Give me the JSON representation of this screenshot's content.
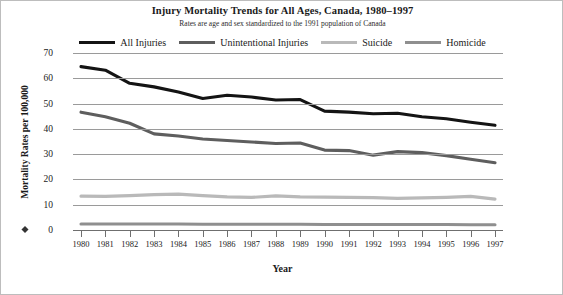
{
  "chart_data": {
    "type": "line",
    "title": "Injury Mortality Trends for All Ages, Canada, 1980–1997",
    "subtitle": "Rates are age and sex standardized to the 1991 population of Canada",
    "xlabel": "Year",
    "ylabel": "Mortality Rates per 100,000",
    "x": [
      1980,
      1981,
      1982,
      1983,
      1984,
      1985,
      1986,
      1987,
      1988,
      1989,
      1990,
      1991,
      1992,
      1993,
      1994,
      1995,
      1996,
      1997
    ],
    "categories": [
      "1980",
      "1981",
      "1982",
      "1983",
      "1984",
      "1985",
      "1986",
      "1987",
      "1988",
      "1989",
      "1990",
      "1991",
      "1992",
      "1993",
      "1994",
      "1995",
      "1996",
      "1997"
    ],
    "ylim": [
      0,
      70
    ],
    "yticks": [
      0,
      10,
      20,
      30,
      40,
      50,
      60,
      70
    ],
    "ytick_labels": [
      "0",
      "10",
      "20",
      "30",
      "40",
      "50",
      "60",
      "70"
    ],
    "grid": true,
    "legend_position": "top-center",
    "series": [
      {
        "name": "All Injuries",
        "color": "#141414",
        "width": 3.1,
        "values": [
          64.6,
          63.2,
          58.0,
          56.6,
          54.6,
          52.0,
          53.3,
          52.6,
          51.4,
          51.6,
          47.0,
          46.6,
          46.0,
          46.2,
          44.8,
          44.0,
          42.6,
          41.4
        ]
      },
      {
        "name": "Unintentional Injuries",
        "color": "#5e5e5e",
        "width": 3.1,
        "values": [
          46.6,
          44.8,
          42.2,
          38.0,
          37.2,
          36.0,
          35.4,
          34.8,
          34.2,
          34.4,
          31.6,
          31.4,
          29.6,
          31.0,
          30.6,
          29.4,
          28.0,
          26.6
        ]
      },
      {
        "name": "Suicide",
        "color": "#b9b9b9",
        "width": 3.1,
        "values": [
          13.4,
          13.3,
          13.6,
          14.0,
          14.2,
          13.6,
          13.1,
          12.9,
          13.5,
          13.1,
          13.0,
          12.9,
          12.8,
          12.5,
          12.7,
          12.9,
          13.3,
          12.2
        ]
      },
      {
        "name": "Homicide",
        "color": "#8f8f8f",
        "width": 3.1,
        "values": [
          2.4,
          2.4,
          2.4,
          2.4,
          2.4,
          2.3,
          2.3,
          2.3,
          2.3,
          2.3,
          2.2,
          2.2,
          2.2,
          2.2,
          2.2,
          2.2,
          2.1,
          2.1
        ]
      }
    ]
  },
  "chart": {
    "title": "Injury Mortality Trends for All Ages, Canada, 1980–1997",
    "subtitle": "Rates are age and sex standardized to the 1991 population of Canada",
    "x_axis_title": "Year",
    "y_axis_title": "Mortality Rates per 100,000"
  },
  "legend": {
    "items": [
      {
        "label": "All Injuries",
        "color": "#141414"
      },
      {
        "label": "Unintentional Injuries",
        "color": "#5e5e5e"
      },
      {
        "label": "Suicide",
        "color": "#b9b9b9"
      },
      {
        "label": "Homicide",
        "color": "#8f8f8f"
      }
    ]
  }
}
